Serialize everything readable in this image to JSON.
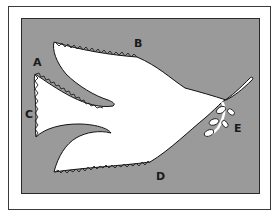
{
  "figure": {
    "colors": {
      "background": "#ffffff",
      "frame": "#3a3a3a",
      "panel": "#9a9a9a",
      "dove": "#ffffff",
      "stitch": "#222222"
    },
    "labels": [
      {
        "id": "A",
        "text": "A",
        "x": 33,
        "y": 66
      },
      {
        "id": "B",
        "text": "B",
        "x": 134,
        "y": 47
      },
      {
        "id": "C",
        "text": "C",
        "x": 25,
        "y": 118
      },
      {
        "id": "D",
        "text": "D",
        "x": 156,
        "y": 180
      },
      {
        "id": "E",
        "text": "E",
        "x": 234,
        "y": 132
      }
    ]
  }
}
